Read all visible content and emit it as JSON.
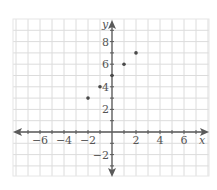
{
  "chart_data": {
    "type": "scatter",
    "title": "",
    "xlabel": "x",
    "ylabel": "y",
    "xlim": [
      -8.25,
      8
    ],
    "ylim": [
      -3.9,
      10
    ],
    "grid": true,
    "legend": null,
    "x_ticks": [
      -6,
      -4,
      -2,
      2,
      4,
      6
    ],
    "y_ticks": [
      -2,
      2,
      4,
      6,
      8
    ],
    "series": [
      {
        "name": "points",
        "points": [
          {
            "x": -2,
            "y": 3
          },
          {
            "x": -1,
            "y": 4
          },
          {
            "x": 0,
            "y": 5
          },
          {
            "x": 1,
            "y": 6
          },
          {
            "x": 2,
            "y": 7
          }
        ]
      }
    ]
  },
  "colors": {
    "grid": "#dcdcdc",
    "border": "#e6e6e6",
    "axis": "#5a5a5a",
    "point": "#4a4a4a",
    "label": "#555555"
  }
}
